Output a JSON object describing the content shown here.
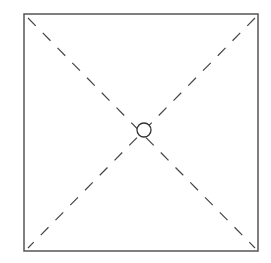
{
  "diagram": {
    "square": {
      "x": 24,
      "y": 14,
      "width": 234,
      "height": 237,
      "stroke": "#555555",
      "stroke_width": 1.5
    },
    "diagonals": [
      {
        "x1": 28,
        "y1": 18,
        "x2": 255,
        "y2": 248
      },
      {
        "x1": 255,
        "y1": 18,
        "x2": 28,
        "y2": 248
      }
    ],
    "diagonal_style": {
      "stroke": "#444444",
      "stroke_width": 1.2,
      "dash": "11,10"
    },
    "center_circle": {
      "cx": 144,
      "cy": 130,
      "r": 7,
      "stroke": "#333333",
      "stroke_width": 1.3
    },
    "colors": {
      "background": "#ffffff"
    }
  }
}
